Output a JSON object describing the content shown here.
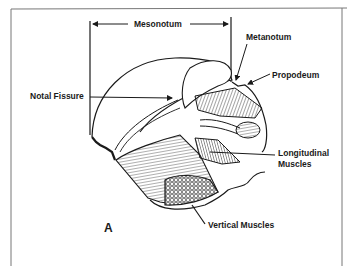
{
  "figure": {
    "panel_letter": "A"
  },
  "labels": {
    "mesonotum": "Mesonotum",
    "metanotum": "Metanotum",
    "propodeum": "Propodeum",
    "notal_fissure": "Notal Fissure",
    "longitudinal_muscles_line1": "Longitudinal",
    "longitudinal_muscles_line2": "Muscles",
    "vertical_muscles": "Vertical Muscles"
  },
  "colors": {
    "ink": "#1a1a1a",
    "background": "#ffffff",
    "frame": "#555555"
  }
}
